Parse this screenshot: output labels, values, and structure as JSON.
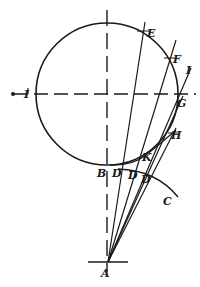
{
  "figure": {
    "type": "geometric-construction",
    "background": "#ffffff",
    "ink": "#1a1a1a",
    "circle": {
      "cx": 107,
      "cy": 94,
      "r": 71
    },
    "axes": {
      "horizontal": {
        "y": 94,
        "x1": 6,
        "x2": 196,
        "style": "dashed"
      },
      "vertical": {
        "x": 107,
        "y1": 8,
        "y2": 272,
        "style": "dashed"
      }
    },
    "origin_tick": {
      "x1": 88,
      "x2": 128,
      "y": 262
    },
    "points": {
      "A": {
        "x": 108,
        "y": 262
      },
      "E": {
        "x": 143,
        "y": 31
      },
      "F": {
        "x": 170,
        "y": 58
      },
      "G": {
        "x": 180,
        "y": 94
      },
      "H": {
        "x": 174,
        "y": 133
      },
      "I_end": {
        "x": 190,
        "y": 70
      },
      "K": {
        "x": 146,
        "y": 155
      }
    },
    "labels": [
      {
        "id": "label-A",
        "text": "A",
        "x": 101,
        "y": 274
      },
      {
        "id": "label-B",
        "text": "B",
        "x": 98,
        "y": 176
      },
      {
        "id": "label-D1",
        "text": "D",
        "x": 113,
        "y": 176
      },
      {
        "id": "label-D2",
        "text": "D",
        "x": 129,
        "y": 178
      },
      {
        "id": "label-D3",
        "text": "D",
        "x": 142,
        "y": 182
      },
      {
        "id": "label-C",
        "text": "C",
        "x": 164,
        "y": 203
      },
      {
        "id": "label-E",
        "text": "E",
        "x": 148,
        "y": 36
      },
      {
        "id": "label-F",
        "text": "F",
        "x": 174,
        "y": 62
      },
      {
        "id": "label-G",
        "text": "G",
        "x": 178,
        "y": 106
      },
      {
        "id": "label-H",
        "text": "H",
        "x": 172,
        "y": 138
      },
      {
        "id": "label-I-right",
        "text": "I",
        "x": 187,
        "y": 73
      },
      {
        "id": "label-I-left",
        "text": "I",
        "x": 25,
        "y": 97
      },
      {
        "id": "label-K",
        "text": "K",
        "x": 143,
        "y": 160
      }
    ],
    "rays": [
      {
        "id": "ray-AE",
        "x2": 145,
        "y2": 22
      },
      {
        "id": "ray-AF",
        "x2": 176,
        "y2": 40
      },
      {
        "id": "ray-AI",
        "x2": 191,
        "y2": 68
      },
      {
        "id": "ray-AG",
        "x2": 183,
        "y2": 96
      },
      {
        "id": "ray-AH",
        "x2": 176,
        "y2": 128
      }
    ],
    "arc_C": {
      "path": "M 110 166 Q 130 164 146 155 Q 150 152 152 150"
    },
    "arc_C2": {
      "path": "M 122 170 Q 158 172 178 198"
    }
  }
}
